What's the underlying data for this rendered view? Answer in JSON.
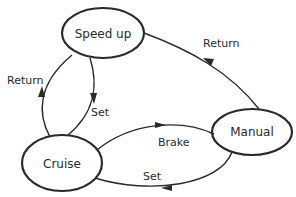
{
  "diagram": {
    "type": "state-machine",
    "colors": {
      "stroke": "#2a2a2a",
      "text": "#2a2a2a",
      "background": "#ffffff"
    },
    "states": [
      {
        "id": "speed_up",
        "label": "Speed up"
      },
      {
        "id": "cruise",
        "label": "Cruise"
      },
      {
        "id": "manual",
        "label": "Manual"
      }
    ],
    "transitions": [
      {
        "from": "cruise",
        "to": "speed_up",
        "label": "Return"
      },
      {
        "from": "speed_up",
        "to": "cruise",
        "label": "Set"
      },
      {
        "from": "manual",
        "to": "speed_up",
        "label": "Return"
      },
      {
        "from": "cruise",
        "to": "manual",
        "label": "Brake"
      },
      {
        "from": "manual",
        "to": "cruise",
        "label": "Set"
      }
    ]
  }
}
